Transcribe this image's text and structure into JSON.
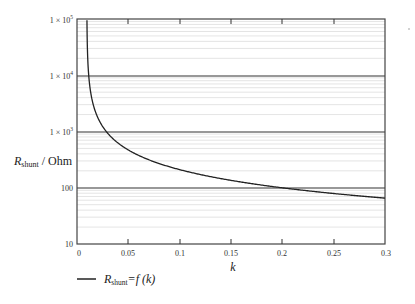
{
  "chart_data": {
    "type": "line",
    "title": "",
    "xlabel": "k",
    "ylabel": "R_shunt / Ohm",
    "ylabel_main": "R",
    "ylabel_sub": "shunt",
    "ylabel_suffix": " / Ohm",
    "xlim": [
      0,
      0.3
    ],
    "ylim": [
      10,
      100000
    ],
    "yscale": "log",
    "grid": true,
    "x_ticks": [
      "0",
      "0.05",
      "0.1",
      "0.15",
      "0.2",
      "0.25",
      "0.3"
    ],
    "y_ticks": [
      "10",
      "100",
      "1 × 10³",
      "1 × 10⁴",
      "1 × 10⁵"
    ],
    "legend": {
      "position": "bottom-left",
      "entries": [
        "R_shunt=f(k)"
      ]
    },
    "series": [
      {
        "name": "R_shunt=f(k)",
        "x": [
          0.0097,
          0.0105,
          0.0117,
          0.014,
          0.018,
          0.022,
          0.028,
          0.035,
          0.045,
          0.06,
          0.08,
          0.1,
          0.125,
          0.15,
          0.175,
          0.2,
          0.225,
          0.25,
          0.275,
          0.3
        ],
        "values": [
          100000,
          19000,
          10000,
          4000,
          2000,
          1500,
          1000,
          750,
          540,
          380,
          270,
          210,
          165,
          135,
          115,
          100,
          88,
          79,
          72,
          65
        ]
      }
    ]
  },
  "legend": {
    "main": "R",
    "sub": "shunt",
    "suffix": "=f (k)"
  },
  "axes": {
    "xlabel": "k",
    "ylabel_main": "R",
    "ylabel_sub": "shunt",
    "ylabel_suffix": " / Ohm",
    "x_ticks": [
      "0",
      "0.05",
      "0.1",
      "0.15",
      "0.2",
      "0.25",
      "0.3"
    ],
    "y_ticks": {
      "t10": "10",
      "t100": "100",
      "t1e3_base": "1 × 10",
      "t1e3_exp": "3",
      "t1e4_base": "1 × 10",
      "t1e4_exp": "4",
      "t1e5_base": "1 × 10",
      "t1e5_exp": "5"
    }
  }
}
